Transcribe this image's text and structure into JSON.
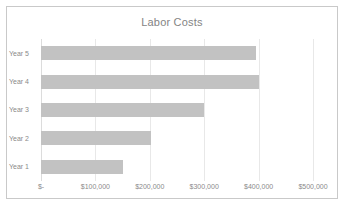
{
  "chart_data": {
    "type": "bar",
    "orientation": "horizontal",
    "title": "Labor Costs",
    "xlabel": "",
    "ylabel": "",
    "categories": [
      "Year 1",
      "Year 2",
      "Year 3",
      "Year 4",
      "Year 5"
    ],
    "values": [
      150000,
      202000,
      300000,
      400000,
      395000
    ],
    "display_order_top_to_bottom": [
      "Year 5",
      "Year 4",
      "Year 3",
      "Year 2",
      "Year 1"
    ],
    "xlim": [
      0,
      500000
    ],
    "x_tick_values": [
      0,
      100000,
      200000,
      300000,
      400000,
      500000
    ],
    "x_tick_labels": [
      "$-",
      "$100,000",
      "$200,000",
      "$300,000",
      "$400,000",
      "$500,000"
    ],
    "grid": "vertical-only",
    "legend": "none",
    "series": [
      {
        "name": "Labor Costs",
        "color": "#c2c2c2",
        "points": [
          {
            "category": "Year 5",
            "value": 395000
          },
          {
            "category": "Year 4",
            "value": 400000
          },
          {
            "category": "Year 3",
            "value": 300000
          },
          {
            "category": "Year 2",
            "value": 202000
          },
          {
            "category": "Year 1",
            "value": 150000
          }
        ]
      }
    ]
  },
  "chart": {
    "title": "Labor Costs",
    "bars": [
      {
        "label": "Year 5",
        "value": 395000
      },
      {
        "label": "Year 4",
        "value": 400000
      },
      {
        "label": "Year 3",
        "value": 300000
      },
      {
        "label": "Year 2",
        "value": 202000
      },
      {
        "label": "Year 1",
        "value": 150000
      }
    ],
    "x_ticks": [
      {
        "label": "$-",
        "value": 0
      },
      {
        "label": "$100,000",
        "value": 100000
      },
      {
        "label": "$200,000",
        "value": 200000
      },
      {
        "label": "$300,000",
        "value": 300000
      },
      {
        "label": "$400,000",
        "value": 400000
      },
      {
        "label": "$500,000",
        "value": 500000
      }
    ],
    "colors": {
      "bar_fill": "#c2c2c2",
      "gridline": "#e8e8e8",
      "frame_border": "#c9c9c9",
      "title_text": "#848484",
      "axis_text": "#8a8a8a",
      "plot_background": "#ffffff"
    }
  }
}
